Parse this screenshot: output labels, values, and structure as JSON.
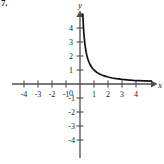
{
  "figure": {
    "problem_number": "7.",
    "axis_labels": {
      "x": "x",
      "y": "y"
    },
    "origin_label": "0"
  },
  "chart_data": {
    "type": "line",
    "title": "",
    "subtitle": "",
    "xlabel": "x",
    "ylabel": "y",
    "legend": [],
    "grid": false,
    "xlim": [
      -5,
      5.2
    ],
    "ylim": [
      -4.8,
      5.0
    ],
    "x_ticks": [
      -4,
      -3,
      -2,
      -1,
      1,
      2,
      3,
      4
    ],
    "y_ticks": [
      -4,
      -3,
      -2,
      -1,
      1,
      2,
      3,
      4
    ],
    "x_tick_labels": [
      "-4",
      "-3",
      "-2",
      "-1",
      "1",
      "2",
      "3",
      "4"
    ],
    "y_tick_labels": [
      "-4",
      "-3",
      "-2",
      "-1",
      "1",
      "2",
      "3",
      "4"
    ],
    "origin_label": "0",
    "x_axis_arrow": "right",
    "y_axis_arrow": "up",
    "annotations": [],
    "series": [
      {
        "name": "y = 1/x",
        "type": "curve",
        "domain": [
          0.2,
          5.1
        ],
        "asymptotes": {
          "vertical": 0,
          "horizontal": 0
        },
        "x": [
          0.2,
          0.22,
          0.25,
          0.28,
          0.32,
          0.36,
          0.4,
          0.45,
          0.5,
          0.56,
          0.63,
          0.7,
          0.8,
          0.9,
          1.0,
          1.2,
          1.4,
          1.6,
          1.8,
          2.0,
          2.3,
          2.6,
          3.0,
          3.4,
          3.8,
          4.2,
          4.6,
          5.1
        ],
        "y": [
          5.0,
          4.55,
          4.0,
          3.57,
          3.13,
          2.78,
          2.5,
          2.22,
          2.0,
          1.79,
          1.59,
          1.43,
          1.25,
          1.11,
          1.0,
          0.83,
          0.71,
          0.63,
          0.56,
          0.5,
          0.43,
          0.38,
          0.33,
          0.29,
          0.26,
          0.24,
          0.22,
          0.2
        ]
      }
    ]
  },
  "style": {
    "axis_color": "#4d4d4d",
    "curve_color": "#111111",
    "text_color": "#1a1a1a",
    "background": "#ffffff"
  }
}
